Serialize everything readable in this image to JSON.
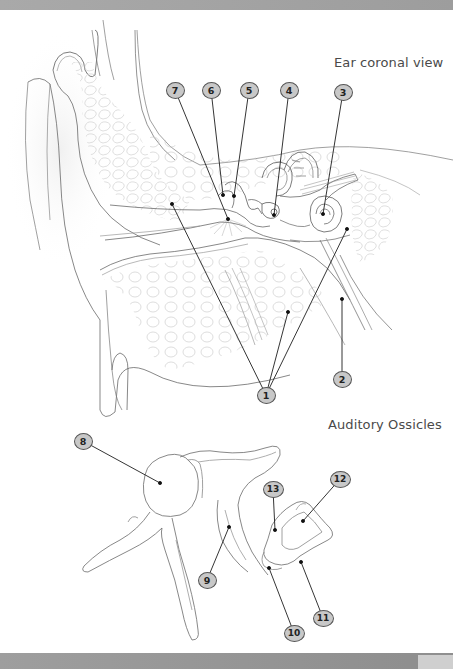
{
  "header_bar": {
    "color": "#a3a3a3"
  },
  "footer_bar": {
    "color": "#979797"
  },
  "figures": [
    {
      "id": "ear",
      "title": "Ear coronal view",
      "labels": [
        {
          "n": "1",
          "x": 266,
          "y": 395,
          "targets": [
            [
              172,
              204
            ],
            [
              288,
              312
            ],
            [
              347,
              229
            ]
          ]
        },
        {
          "n": "2",
          "x": 342,
          "y": 379,
          "targets": [
            [
              342,
              299
            ]
          ]
        },
        {
          "n": "3",
          "x": 343,
          "y": 92,
          "targets": [
            [
              323,
              214
            ]
          ]
        },
        {
          "n": "4",
          "x": 289,
          "y": 90,
          "targets": [
            [
              274,
              215
            ]
          ]
        },
        {
          "n": "5",
          "x": 249,
          "y": 90,
          "targets": [
            [
              234,
              196
            ]
          ]
        },
        {
          "n": "6",
          "x": 211,
          "y": 90,
          "targets": [
            [
              223,
              195
            ]
          ]
        },
        {
          "n": "7",
          "x": 175,
          "y": 90,
          "targets": [
            [
              228,
              219
            ]
          ]
        }
      ]
    },
    {
      "id": "ossicles",
      "title": "Auditory Ossicles",
      "labels": [
        {
          "n": "8",
          "x": 83,
          "y": 441,
          "targets": [
            [
              160,
              483
            ]
          ]
        },
        {
          "n": "9",
          "x": 207,
          "y": 580,
          "targets": [
            [
              229,
              527
            ]
          ]
        },
        {
          "n": "10",
          "x": 294,
          "y": 633,
          "targets": [
            [
              269,
              568
            ]
          ]
        },
        {
          "n": "11",
          "x": 323,
          "y": 618,
          "targets": [
            [
              301,
              562
            ]
          ]
        },
        {
          "n": "12",
          "x": 340,
          "y": 479,
          "targets": [
            [
              303,
              521
            ]
          ]
        },
        {
          "n": "13",
          "x": 273,
          "y": 489,
          "targets": [
            [
              275,
              530
            ]
          ]
        }
      ]
    }
  ]
}
